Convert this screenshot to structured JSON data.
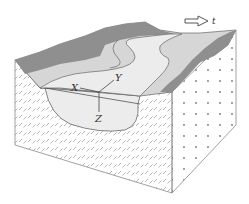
{
  "diagram": {
    "type": "3d-block-diagram",
    "flow_arrow": {
      "label": "t",
      "direction": "right"
    },
    "axes": {
      "x_label": "X",
      "y_label": "Y",
      "z_label": "Z"
    },
    "colors": {
      "background": "#ffffff",
      "bank_dark": "#8f8f8f",
      "floodplain_light": "#d6d6d6",
      "channel": "#ececec",
      "outline": "#555555",
      "front_texture": "#9a9a9a",
      "side_dots": "#777777"
    },
    "faces": {
      "front": "dashed-hatch texture (sediment)",
      "right": "dotted texture",
      "top": "meandering river surface with dark banks and light floodplain"
    }
  }
}
